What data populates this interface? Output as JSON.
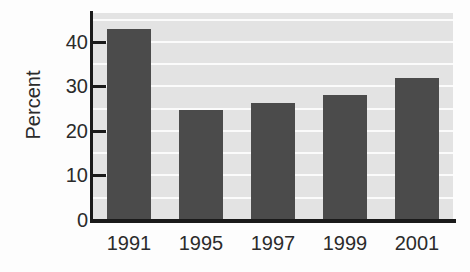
{
  "chart_data": {
    "type": "bar",
    "title": "",
    "subtitle": "",
    "xlabel": "",
    "ylabel": "Percent",
    "categories": [
      "1991",
      "1995",
      "1997",
      "1999",
      "2001"
    ],
    "values": [
      43,
      24.8,
      26.2,
      28,
      32
    ],
    "series": [
      {
        "name": "Percent",
        "values": [
          43,
          24.8,
          26.2,
          28,
          32
        ]
      }
    ],
    "ylim": [
      0,
      46.5
    ],
    "xlim": [
      0,
      5
    ],
    "yticks": [
      0,
      10,
      20,
      30,
      40
    ],
    "ytick_labels": [
      "0",
      "10",
      "20",
      "30",
      "40"
    ],
    "gridlines": [
      5,
      10,
      15,
      20,
      25,
      30,
      35,
      40,
      45
    ],
    "grid": true,
    "grid_axis": "y",
    "grid_color": "#fbfbfb",
    "legend": false,
    "legend_position": "none",
    "annotations": [],
    "colors": {
      "bar": "#4b4b4b",
      "plot_background": "#e3e3e3",
      "figure_background": "#fdfdfd",
      "axis": "#1a1a1a",
      "text": "#2b2b2b"
    }
  }
}
